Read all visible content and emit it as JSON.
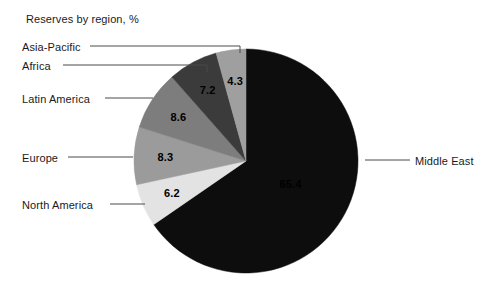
{
  "chart_data": {
    "type": "pie",
    "title": "Reserves by region, %",
    "xlabel": "",
    "ylabel": "",
    "legend_position": "callout-labels",
    "grid": false,
    "unit": "%",
    "start_angle_deg": 0,
    "direction": "clockwise",
    "categories": [
      "Middle East",
      "North America",
      "Europe",
      "Latin America",
      "Africa",
      "Asia-Pacific"
    ],
    "values": [
      65.4,
      6.2,
      8.3,
      8.6,
      7.2,
      4.3
    ],
    "slices": [
      {
        "label": "Middle East",
        "value": 65.4,
        "value_text": "65.4",
        "color": "#0d0d0d",
        "value_text_color": "#000000",
        "value_visible": false
      },
      {
        "label": "North America",
        "value": 6.2,
        "value_text": "6.2",
        "color": "#e3e3e3",
        "value_text_color": "#000000",
        "value_visible": true
      },
      {
        "label": "Europe",
        "value": 8.3,
        "value_text": "8.3",
        "color": "#9b9b9b",
        "value_text_color": "#000000",
        "value_visible": true
      },
      {
        "label": "Latin America",
        "value": 8.6,
        "value_text": "8.6",
        "color": "#7d7d7d",
        "value_text_color": "#000000",
        "value_visible": true
      },
      {
        "label": "Africa",
        "value": 7.2,
        "value_text": "7.2",
        "color": "#3b3b3b",
        "value_text_color": "#000000",
        "value_visible": true
      },
      {
        "label": "Asia-Pacific",
        "value": 4.3,
        "value_text": "4.3",
        "color": "#9f9f9f",
        "value_text_color": "#000000",
        "value_visible": true
      }
    ]
  },
  "callouts": [
    {
      "label": "Asia-Pacific",
      "text_x": 22,
      "text_y": 41,
      "line_x1": 90,
      "line_x2": 240,
      "line_y": 46,
      "elbow_y": 53,
      "side": "left"
    },
    {
      "label": "Africa",
      "text_x": 22,
      "text_y": 60,
      "line_x1": 63,
      "line_x2": 207,
      "line_y": 65,
      "elbow_y": 72,
      "side": "left"
    },
    {
      "label": "Latin America",
      "text_x": 22,
      "text_y": 93,
      "line_x1": 105,
      "line_x2": 153,
      "line_y": 98,
      "elbow_y": 98,
      "side": "left"
    },
    {
      "label": "Europe",
      "text_x": 22,
      "text_y": 152,
      "line_x1": 68,
      "line_x2": 133,
      "line_y": 157,
      "elbow_y": 157,
      "side": "left"
    },
    {
      "label": "North America",
      "text_x": 22,
      "text_y": 199,
      "line_x1": 110,
      "line_x2": 145,
      "line_y": 204,
      "elbow_y": 204,
      "side": "left"
    },
    {
      "label": "Middle East",
      "text_x": 415,
      "text_y": 155,
      "line_x1": 365,
      "line_x2": 410,
      "line_y": 160,
      "elbow_y": 160,
      "side": "right"
    }
  ],
  "geometry": {
    "center_x": 246,
    "center_y": 161,
    "radius": 112
  },
  "colors": {
    "background": "#ffffff",
    "text": "#1a1a1a",
    "leader_line": "#4a4a4a"
  }
}
